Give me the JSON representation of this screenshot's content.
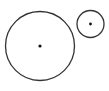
{
  "diagram": {
    "width": 109,
    "height": 91,
    "background": "#ffffff",
    "stroke_color": "#333333",
    "dot_color": "#111111",
    "circles": [
      {
        "name": "large-circle",
        "cx": 40,
        "cy": 46,
        "r": 34.5,
        "center_dot_r": 1.6
      },
      {
        "name": "small-circle",
        "cx": 90.5,
        "cy": 24,
        "r": 13.5,
        "center_dot_r": 1.4
      }
    ]
  }
}
